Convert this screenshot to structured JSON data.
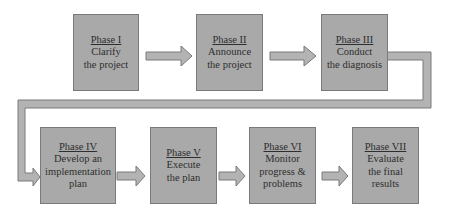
{
  "diagram": {
    "type": "process-flow",
    "colors": {
      "box_fill": "#a9a9a9",
      "box_border": "#7a7a7a",
      "arrow_fill": "#b3b3b3",
      "text": "#2e2e2e"
    },
    "phases": [
      {
        "title": "Phase I",
        "lines": [
          "Clarify",
          "the project"
        ]
      },
      {
        "title": "Phase II",
        "lines": [
          "Announce",
          "the project"
        ]
      },
      {
        "title": "Phase III",
        "lines": [
          "Conduct",
          "the diagnosis"
        ]
      },
      {
        "title": "Phase IV",
        "lines": [
          "Develop an",
          "implementation",
          "plan"
        ]
      },
      {
        "title": "Phase V",
        "lines": [
          "Execute",
          "the plan"
        ]
      },
      {
        "title": "Phase VI",
        "lines": [
          "Monitor",
          "progress &",
          "problems"
        ]
      },
      {
        "title": "Phase VII",
        "lines": [
          "Evaluate",
          "the final",
          "results"
        ]
      }
    ],
    "flow": [
      "Phase I",
      "Phase II",
      "Phase III",
      "Phase IV",
      "Phase V",
      "Phase VI",
      "Phase VII"
    ]
  }
}
